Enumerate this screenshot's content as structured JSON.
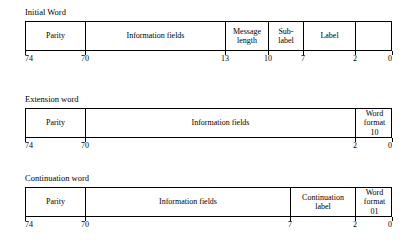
{
  "document": {
    "kind": "word-format-bit-field-diagrams"
  },
  "diagrams": [
    {
      "title": "Initial Word",
      "cells": [
        {
          "label": "Parity"
        },
        {
          "label": "Information fields"
        },
        {
          "label": "Message\nlength"
        },
        {
          "label": "Sub-\nlabel"
        },
        {
          "label": "Label"
        },
        {
          "label": ""
        }
      ],
      "bit_labels": [
        "74",
        "70",
        "13",
        "10",
        "7",
        "2",
        "0"
      ]
    },
    {
      "title": "Extension word",
      "cells": [
        {
          "label": "Parity"
        },
        {
          "label": "Information fields"
        },
        {
          "label": "Word\nformat\n10"
        }
      ],
      "bit_labels": [
        "74",
        "70",
        "2",
        "0"
      ]
    },
    {
      "title": "Continuation word",
      "cells": [
        {
          "label": "Parity"
        },
        {
          "label": "Information fields"
        },
        {
          "label": "Continuation\nlabel"
        },
        {
          "label": "Word\nformat\n01"
        }
      ],
      "bit_labels": [
        "74",
        "70",
        "7",
        "2",
        "0"
      ]
    }
  ],
  "geometry": {
    "box_left": 25,
    "box_right": 392,
    "diagrams": [
      {
        "title_x": 25,
        "title_y": 7,
        "box_top": 21,
        "box_height": 30,
        "dividers": [
          25,
          85,
          225,
          268,
          303,
          355,
          392
        ],
        "tick_label_y": 54
      },
      {
        "title_x": 25,
        "title_y": 94,
        "box_top": 108,
        "box_height": 30,
        "dividers": [
          25,
          85,
          355,
          392
        ],
        "tick_label_y": 141
      },
      {
        "title_x": 25,
        "title_y": 173,
        "box_top": 187,
        "box_height": 30,
        "dividers": [
          25,
          85,
          290,
          355,
          392
        ],
        "tick_label_y": 220
      }
    ]
  },
  "colors": {
    "line": "#000000",
    "background": "#ffffff",
    "text": "#000000"
  }
}
